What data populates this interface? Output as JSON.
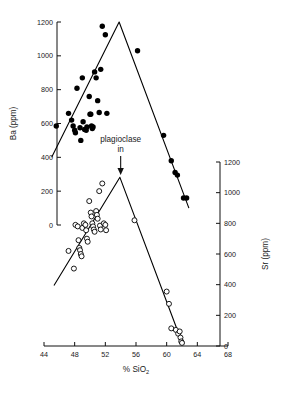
{
  "chart_data": {
    "type": "scatter",
    "title": "",
    "xlabel": "% SiO2",
    "xlabel_main": "% SiO",
    "xlabel_sub": "2",
    "xlim": [
      44,
      68
    ],
    "xticks": [
      44,
      48,
      52,
      56,
      60,
      64,
      68
    ],
    "xticklabels": [
      "44",
      "48",
      "52",
      "56",
      "60",
      "64",
      "68"
    ],
    "grid": false,
    "legend": "none",
    "axes": [
      {
        "id": "left",
        "label": "Ba (ppm)",
        "position": "left",
        "lim": [
          0,
          1200
        ],
        "ticks": [
          0,
          200,
          400,
          600,
          800,
          1000,
          1200
        ],
        "ticklabels": [
          "0",
          "200",
          "400",
          "600",
          "800",
          "1000",
          "1200"
        ]
      },
      {
        "id": "right",
        "label": "Sr (ppm)",
        "position": "right",
        "lim": [
          0,
          1200
        ],
        "ticks": [
          0,
          200,
          400,
          600,
          800,
          1000,
          1200
        ],
        "ticklabels": [
          "0",
          "200",
          "400",
          "600",
          "800",
          "1000",
          "1200"
        ]
      }
    ],
    "annotations": [
      {
        "name": "plagioclase-in",
        "line1": "plagioclase",
        "line2": "in",
        "x": 54.0,
        "arrow": "down"
      }
    ],
    "series": [
      {
        "name": "Ba",
        "axis": "left",
        "marker": "filled-circle",
        "color": "#000000",
        "points": [
          [
            45.6,
            585
          ],
          [
            47.2,
            660
          ],
          [
            47.6,
            620
          ],
          [
            47.8,
            585
          ],
          [
            48.0,
            560
          ],
          [
            48.1,
            545
          ],
          [
            48.3,
            808
          ],
          [
            48.7,
            575
          ],
          [
            48.8,
            500
          ],
          [
            49.0,
            870
          ],
          [
            49.1,
            610
          ],
          [
            49.3,
            565
          ],
          [
            49.5,
            560
          ],
          [
            49.6,
            580
          ],
          [
            49.9,
            760
          ],
          [
            50.0,
            655
          ],
          [
            50.1,
            655
          ],
          [
            50.2,
            585
          ],
          [
            50.3,
            570
          ],
          [
            50.4,
            580
          ],
          [
            50.6,
            905
          ],
          [
            50.8,
            870
          ],
          [
            51.0,
            735
          ],
          [
            51.2,
            665
          ],
          [
            51.4,
            920
          ],
          [
            51.6,
            1175
          ],
          [
            52.0,
            1125
          ],
          [
            52.2,
            660
          ],
          [
            56.2,
            1030
          ],
          [
            59.6,
            530
          ],
          [
            60.6,
            380
          ],
          [
            61.1,
            310
          ],
          [
            61.4,
            295
          ],
          [
            62.2,
            160
          ],
          [
            62.6,
            160
          ]
        ],
        "trend": [
          [
            45.0,
            400
          ],
          [
            53.8,
            1200
          ],
          [
            62.9,
            100
          ]
        ]
      },
      {
        "name": "Sr",
        "axis": "right",
        "marker": "open-circle",
        "color": "#000000",
        "points": [
          [
            47.2,
            620
          ],
          [
            47.9,
            505
          ],
          [
            48.1,
            790
          ],
          [
            48.4,
            780
          ],
          [
            48.5,
            690
          ],
          [
            48.6,
            640
          ],
          [
            48.7,
            625
          ],
          [
            48.8,
            600
          ],
          [
            48.9,
            585
          ],
          [
            49.0,
            770
          ],
          [
            49.2,
            800
          ],
          [
            49.4,
            790
          ],
          [
            49.5,
            755
          ],
          [
            49.6,
            700
          ],
          [
            49.7,
            680
          ],
          [
            49.9,
            945
          ],
          [
            50.1,
            870
          ],
          [
            50.2,
            845
          ],
          [
            50.3,
            800
          ],
          [
            50.4,
            780
          ],
          [
            50.5,
            760
          ],
          [
            50.6,
            745
          ],
          [
            50.8,
            880
          ],
          [
            50.9,
            855
          ],
          [
            51.0,
            830
          ],
          [
            51.2,
            1010
          ],
          [
            51.3,
            785
          ],
          [
            51.4,
            760
          ],
          [
            51.6,
            1060
          ],
          [
            51.8,
            800
          ],
          [
            52.0,
            790
          ],
          [
            52.1,
            755
          ],
          [
            55.8,
            820
          ],
          [
            60.0,
            355
          ],
          [
            60.3,
            275
          ],
          [
            60.6,
            115
          ],
          [
            61.2,
            105
          ],
          [
            61.5,
            80
          ],
          [
            61.7,
            95
          ],
          [
            61.8,
            55
          ],
          [
            61.9,
            30
          ],
          [
            62.0,
            20
          ]
        ],
        "trend": [
          [
            45.3,
            395
          ],
          [
            53.9,
            1100
          ],
          [
            62.1,
            10
          ]
        ]
      }
    ]
  }
}
